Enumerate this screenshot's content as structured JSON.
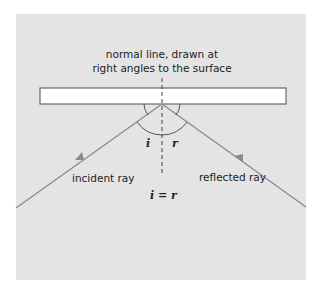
{
  "diagram": {
    "normal_label_line1": "normal line, drawn at",
    "normal_label_line2": "right angles to the surface",
    "angle_i": "i",
    "angle_r": "r",
    "incident_label": "incident ray",
    "reflected_label": "reflected ray",
    "equation": "i = r",
    "colors": {
      "background": "#e4e4e4",
      "mirror_fill": "#ffffff",
      "mirror_stroke": "#6a6a6a",
      "ray": "#8a8a8a",
      "normal": "#444444",
      "arc": "#555555"
    }
  }
}
